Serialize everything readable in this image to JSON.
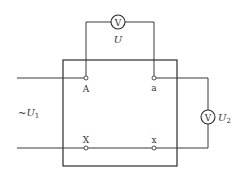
{
  "diagram": {
    "type": "transformer-polarity-test-circuit",
    "colors": {
      "line": "#3a3a3a",
      "background": "#ffffff",
      "text": "#333333"
    },
    "meters": {
      "top": {
        "symbol": "V",
        "label": "U"
      },
      "right": {
        "symbol": "V",
        "label": "U",
        "subscript": "2"
      }
    },
    "source": {
      "prefix": "~",
      "label": "U",
      "subscript": "1"
    },
    "terminals": {
      "A": "A",
      "a": "a",
      "X": "X",
      "x": "x"
    }
  }
}
